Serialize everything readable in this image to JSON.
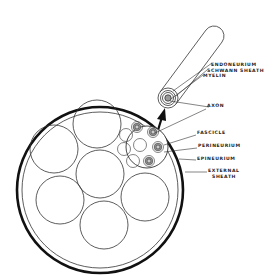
{
  "diagram": {
    "colors": {
      "line": "#222222",
      "shade": "#9a9a9a",
      "background": "#ffffff"
    },
    "labels": {
      "endoneurium": "ENDONEURIUM",
      "schwann_sheath": "SCHWANN SHEATH",
      "myelin": "MYELIN",
      "axon": "AXON",
      "fascicle": "FASCICLE",
      "perineurium": "PERINEURIUM",
      "epineurium": "EPINEURIUM",
      "external_sheath_line1": "EXTERNAL",
      "external_sheath_line2": "SHEATH"
    }
  }
}
